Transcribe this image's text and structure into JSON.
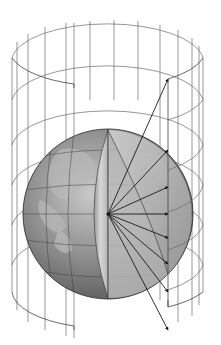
{
  "diagram": {
    "colors": {
      "background": "#ffffff",
      "cylinder_lines": "#6a6a6a",
      "globe_light": "#d0d0d0",
      "globe_dark": "#6e6e6e",
      "rays": "#1a1a1a"
    },
    "elements": [
      {
        "name": "cylinder",
        "description": "wireframe cylinder, cut open in front-right section"
      },
      {
        "name": "globe",
        "description": "shaded earth globe with a wedge section removed"
      },
      {
        "name": "projection-rays",
        "count": 8,
        "description": "arrows radiating from globe center to cylinder wall"
      }
    ]
  }
}
